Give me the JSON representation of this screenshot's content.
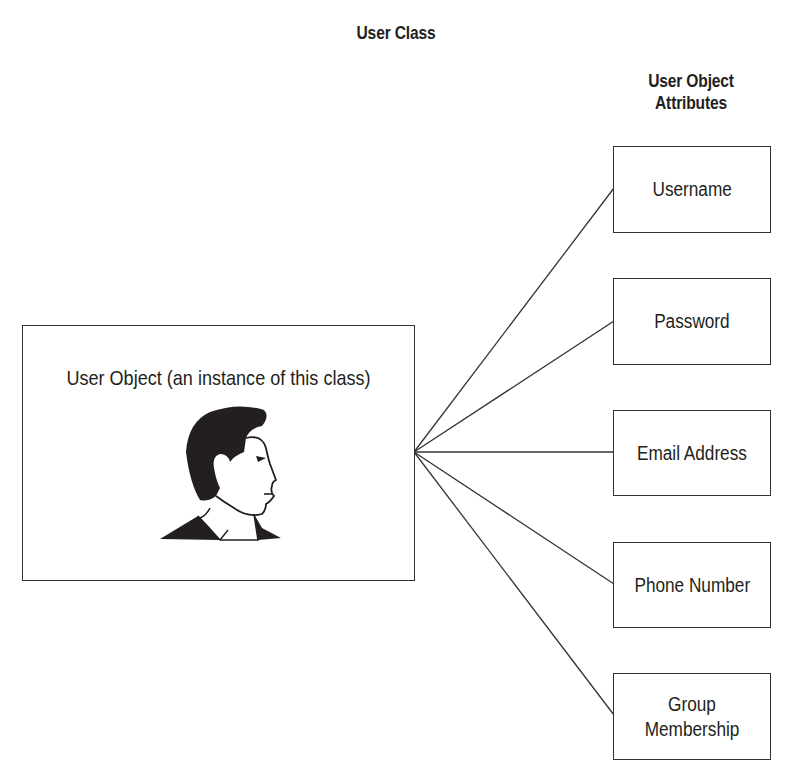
{
  "diagram": {
    "title": "User Class",
    "attributes_heading_line1": "User Object",
    "attributes_heading_line2": "Attributes",
    "object": {
      "label": "User Object (an instance of this class)",
      "icon": "user-profile-icon"
    },
    "attributes": [
      {
        "label": "Username"
      },
      {
        "label": "Password"
      },
      {
        "label": "Email Address"
      },
      {
        "label": "Phone Number"
      },
      {
        "label": "Group Membership"
      }
    ],
    "colors": {
      "stroke": "#333333",
      "text": "#231f20",
      "background": "#ffffff"
    }
  }
}
